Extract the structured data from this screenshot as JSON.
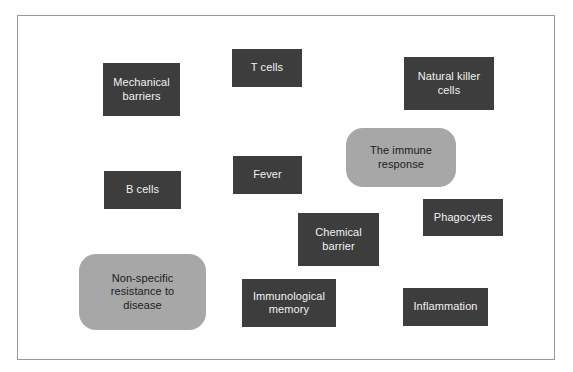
{
  "figure": {
    "background_color": "#ffffff",
    "frame": {
      "border_color": "#9a9a9a",
      "fill_color": "#ffffff"
    },
    "palette": {
      "dark_box_fill": "#3d3d3d",
      "dark_box_text": "#f2f2f2",
      "gray_box_fill": "#a7a7a7",
      "gray_box_text": "#1c1c1c"
    }
  },
  "nodes": [
    {
      "id": "mechanical-barriers",
      "label": "Mechanical\nbarriers",
      "style": "dark",
      "x": 102,
      "y": 62,
      "w": 77,
      "h": 53
    },
    {
      "id": "t-cells",
      "label": "T cells",
      "style": "dark",
      "x": 231,
      "y": 48,
      "w": 70,
      "h": 38
    },
    {
      "id": "natural-killer-cells",
      "label": "Natural killer\ncells",
      "style": "dark",
      "x": 403,
      "y": 56,
      "w": 90,
      "h": 53
    },
    {
      "id": "the-immune-response",
      "label": "The immune\nresponse",
      "style": "gray",
      "x": 345,
      "y": 127,
      "w": 110,
      "h": 59
    },
    {
      "id": "fever",
      "label": "Fever",
      "style": "dark",
      "x": 232,
      "y": 155,
      "w": 69,
      "h": 38
    },
    {
      "id": "b-cells",
      "label": "B cells",
      "style": "dark",
      "x": 103,
      "y": 170,
      "w": 77,
      "h": 38
    },
    {
      "id": "phagocytes",
      "label": "Phagocytes",
      "style": "dark",
      "x": 422,
      "y": 198,
      "w": 80,
      "h": 37
    },
    {
      "id": "chemical-barrier",
      "label": "Chemical\nbarrier",
      "style": "dark",
      "x": 297,
      "y": 212,
      "w": 81,
      "h": 53
    },
    {
      "id": "non-specific-resistance-to-disease",
      "label": "Non-specific\nresistance to\ndisease",
      "style": "gray",
      "x": 78,
      "y": 253,
      "w": 127,
      "h": 76
    },
    {
      "id": "immunological-memory",
      "label": "Immunological\nmemory",
      "style": "dark",
      "x": 241,
      "y": 278,
      "w": 94,
      "h": 48
    },
    {
      "id": "inflammation",
      "label": "Inflammation",
      "style": "dark",
      "x": 402,
      "y": 287,
      "w": 85,
      "h": 38
    }
  ]
}
